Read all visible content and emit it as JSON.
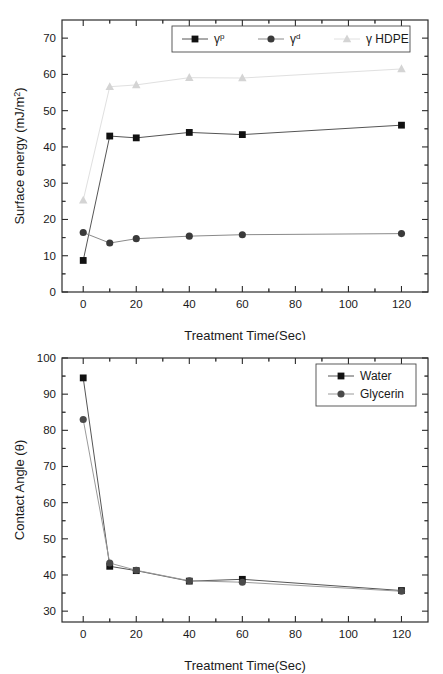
{
  "figure": {
    "background": "#ffffff",
    "panels": [
      "surface-energy-chart",
      "contact-angle-chart"
    ]
  },
  "chart_data": [
    {
      "id": "surface-energy",
      "type": "line",
      "title": "",
      "xlabel": "Treatment Time(Sec)",
      "ylabel": "Surface energy (mJ/m2)",
      "ylabel_main": "Surface energy (mJ/m",
      "ylabel_sup": "2",
      "ylabel_tail": ")",
      "x": [
        0,
        10,
        20,
        40,
        60,
        120
      ],
      "xlim": [
        -8,
        130
      ],
      "ylim": [
        0,
        75
      ],
      "xticks": [
        0,
        20,
        40,
        60,
        80,
        100,
        120
      ],
      "xticklabels": [
        "0",
        "20",
        "40",
        "60",
        "80",
        "100",
        "120"
      ],
      "yticks": [
        0,
        10,
        20,
        30,
        40,
        50,
        60,
        70
      ],
      "yticklabels": [
        "0",
        "10",
        "20",
        "30",
        "40",
        "50",
        "60",
        "70"
      ],
      "grid": false,
      "legend_position": "top-center",
      "series": [
        {
          "name": "gamma-p",
          "label": "γ",
          "label_sup": "p",
          "marker": "square",
          "color": "#111111",
          "line_color": "#555555",
          "values": [
            8.7,
            43.0,
            42.5,
            44.0,
            43.4,
            46.0
          ]
        },
        {
          "name": "gamma-d",
          "label": "γ",
          "label_sup": "d",
          "marker": "circle",
          "color": "#3a3a3a",
          "line_color": "#8a8a8a",
          "values": [
            16.4,
            13.5,
            14.7,
            15.4,
            15.8,
            16.1
          ]
        },
        {
          "name": "gamma-hdpe",
          "label": "γ HDPE",
          "label_sup": "",
          "marker": "triangle",
          "color": "#d4d4d4",
          "line_color": "#e0e0e0",
          "values": [
            25.3,
            56.6,
            57.1,
            59.1,
            59.0,
            61.5
          ]
        }
      ]
    },
    {
      "id": "contact-angle",
      "type": "line",
      "title": "",
      "xlabel": "Treatment Time(Sec)",
      "ylabel": "Contact Angle (θ)",
      "x": [
        0,
        10,
        20,
        40,
        60,
        120
      ],
      "xlim": [
        -8,
        130
      ],
      "ylim": [
        27,
        100
      ],
      "xticks": [
        0,
        20,
        40,
        60,
        80,
        100,
        120
      ],
      "xticklabels": [
        "0",
        "20",
        "40",
        "60",
        "80",
        "100",
        "120"
      ],
      "yticks": [
        30,
        40,
        50,
        60,
        70,
        80,
        90,
        100
      ],
      "yticklabels": [
        "30",
        "40",
        "50",
        "60",
        "70",
        "80",
        "90",
        "100"
      ],
      "grid": false,
      "legend_position": "top-right",
      "series": [
        {
          "name": "water",
          "label": "Water",
          "label_sup": "",
          "marker": "square",
          "color": "#111111",
          "line_color": "#555555",
          "values": [
            94.5,
            42.4,
            41.2,
            38.3,
            38.8,
            35.7
          ]
        },
        {
          "name": "glycerin",
          "label": "Glycerin",
          "label_sup": "",
          "marker": "circle",
          "color": "#4a4a4a",
          "line_color": "#9a9a9a",
          "values": [
            83.0,
            43.3,
            41.3,
            38.4,
            38.0,
            35.5
          ]
        }
      ]
    }
  ]
}
